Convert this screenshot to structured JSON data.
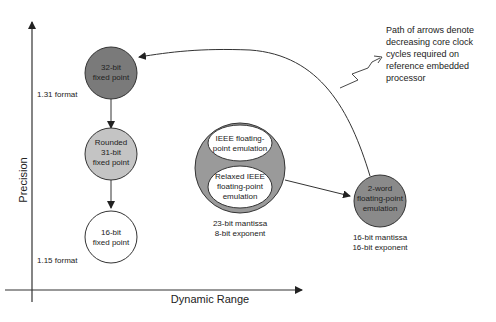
{
  "axes": {
    "y_label": "Precision",
    "x_label": "Dynamic Range",
    "y_ticks": [
      {
        "label": "1.31 format"
      },
      {
        "label": "1.15 format"
      }
    ]
  },
  "nodes": {
    "fixed32": {
      "line1": "32-bit",
      "line2": "fixed point",
      "fill": "#7a7a7a"
    },
    "fixed31": {
      "line1": "Rounded",
      "line2": "31-bit",
      "line3": "fixed point",
      "fill": "#c4c4c4"
    },
    "fixed16": {
      "line1": "16-bit",
      "line2": "fixed point",
      "fill": "#ffffff"
    },
    "ieee_group": {
      "fill": "#9a9a9a",
      "ieee": {
        "line1": "IEEE floating-",
        "line2": "point emulation"
      },
      "relaxed": {
        "line1": "Relaxed IEEE",
        "line2": "floating-point",
        "line3": "emulation"
      },
      "caption1": "23-bit mantissa",
      "caption2": "8-bit exponent"
    },
    "twoword": {
      "line1": "2-word",
      "line2": "floating-point",
      "line3": "emulation",
      "fill": "#8a8a8a",
      "caption1": "16-bit mantissa",
      "caption2": "16-bit exponent"
    }
  },
  "annotation": {
    "line1": "Path of arrows denote",
    "line2": "decreasing core clock",
    "line3": "cycles required on",
    "line4": "reference embedded",
    "line5": "processor"
  }
}
